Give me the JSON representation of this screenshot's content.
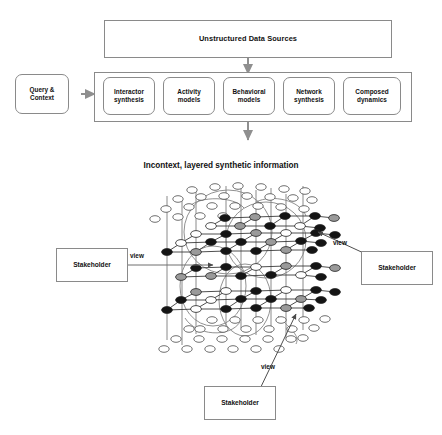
{
  "figure": {
    "top_box": {
      "label": "Unstructured Data Sources"
    },
    "query": {
      "label": "Query &\nContext"
    },
    "stages": [
      {
        "label": "Interactor\nsynthesis"
      },
      {
        "label": "Activity\nmodels"
      },
      {
        "label": "Behavioral\nmodels"
      },
      {
        "label": "Network\nsynthesis"
      },
      {
        "label": "Composed\ndynamics"
      }
    ],
    "section_title": "Incontext, layered synthetic information",
    "view_labels": [
      {
        "id": "view-left",
        "label": "view"
      },
      {
        "id": "view-right",
        "label": "view"
      },
      {
        "id": "view-bottom",
        "label": "view"
      }
    ],
    "stakeholders": [
      {
        "id": "stakeholder-left",
        "label": "Stakeholder"
      },
      {
        "id": "stakeholder-right",
        "label": "Stakeholder"
      },
      {
        "id": "stakeholder-bottom",
        "label": "Stakeholder"
      }
    ],
    "colors": {
      "stroke": "#8a8a8a",
      "node_stroke": "#333333",
      "node_filled": "#141414",
      "node_shaded": "#9a9a9a",
      "node_empty": "#ffffff",
      "text": "#111111",
      "arrow": "#7a7a7a",
      "background": "#ffffff"
    }
  }
}
